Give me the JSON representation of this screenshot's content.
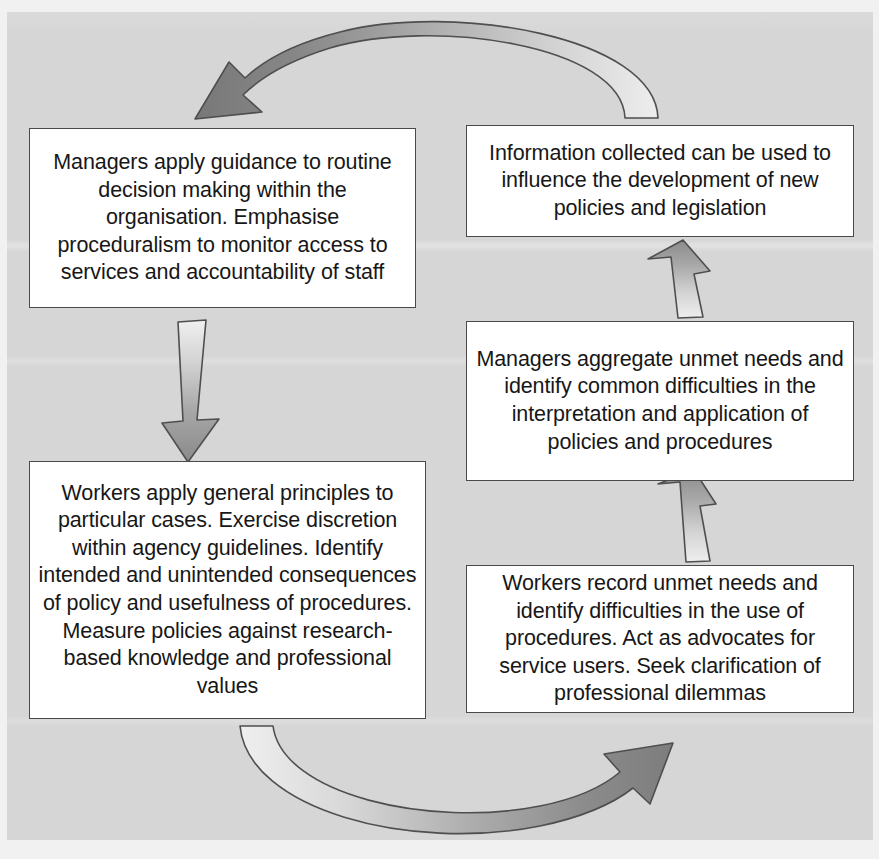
{
  "diagram": {
    "background_color": "#d6d6d6",
    "box_fill": "#ffffff",
    "box_border_color": "#4a4a4a",
    "arrow_fill_dark": "#7a7a7a",
    "arrow_fill_light": "#e6e6e6",
    "arrow_outline": "#4f4f4f"
  },
  "boxes": {
    "managers_guidance": {
      "id": "managers-apply-guidance",
      "text": "Managers apply guidance to routine decision making within the organisation. Emphasise proceduralism to monitor access to services and accountability of staff",
      "position": "top-left"
    },
    "information_collected": {
      "id": "information-collected",
      "text": "Information collected can be used to influence the development of new policies and legislation",
      "position": "top-right"
    },
    "managers_aggregate": {
      "id": "managers-aggregate-unmet-needs",
      "text": "Managers aggregate unmet needs and identify common difficulties in the interpretation and application of policies and procedures",
      "position": "middle-right"
    },
    "workers_apply": {
      "id": "workers-apply-general-principles",
      "text": "Workers apply general principles to particular cases. Exercise discretion within agency guidelines. Identify intended and unintended consequences of policy and usefulness of procedures. Measure policies against research-based knowledge and professional values",
      "position": "bottom-left"
    },
    "workers_record": {
      "id": "workers-record-unmet-needs",
      "text": "Workers record unmet needs and identify difficulties in the use of procedures. Act as advocates for service users. Seek clarification of professional dilemmas",
      "position": "bottom-right"
    }
  },
  "arrows": [
    {
      "id": "arrow-top-curved",
      "from": "information_collected",
      "to": "managers_guidance",
      "direction": "right-to-left",
      "shape": "curved-arc",
      "icon": "curved-arrow-left-icon"
    },
    {
      "id": "arrow-left-down",
      "from": "managers_guidance",
      "to": "workers_apply",
      "direction": "top-to-bottom",
      "shape": "straight",
      "icon": "arrow-down-icon"
    },
    {
      "id": "arrow-bottom-curved",
      "from": "workers_apply",
      "to": "workers_record",
      "direction": "left-to-right",
      "shape": "curved-arc",
      "icon": "curved-arrow-right-icon"
    },
    {
      "id": "arrow-right-lower-up",
      "from": "workers_record",
      "to": "managers_aggregate",
      "direction": "bottom-to-top",
      "shape": "straight",
      "icon": "arrow-up-icon"
    },
    {
      "id": "arrow-right-upper-up",
      "from": "managers_aggregate",
      "to": "information_collected",
      "direction": "bottom-to-top",
      "shape": "straight",
      "icon": "arrow-up-icon"
    }
  ]
}
